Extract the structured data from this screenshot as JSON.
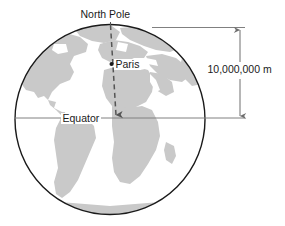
{
  "figure": {
    "labels": {
      "north_pole": "North Pole",
      "paris": "Paris",
      "equator": "Equator",
      "distance": "10,000,000 m"
    },
    "colors": {
      "land": "#c9c9c9",
      "ocean": "#ffffff",
      "outline": "#1a1a1a",
      "line": "#808080",
      "dashed_line": "#555555",
      "text": "#1a1a1a"
    },
    "geometry": {
      "circle_center_x": 110,
      "circle_center_y": 119,
      "circle_radius": 95,
      "equator_y": 118,
      "north_pole_y": 24,
      "dimension_line_x": 240,
      "paris_marker_x": 111,
      "paris_marker_y": 64
    },
    "annotations": {
      "dimension_value": "10,000,000 m",
      "dimension_from": "North Pole",
      "dimension_to": "Equator"
    }
  }
}
